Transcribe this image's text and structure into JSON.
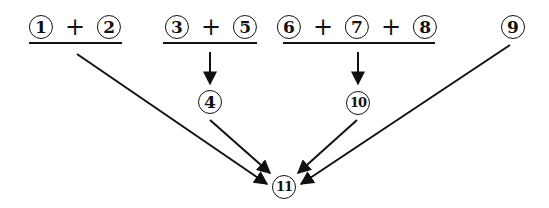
{
  "diagram": {
    "type": "flow",
    "groups": [
      {
        "id": "g1",
        "terms": [
          "1",
          "2"
        ],
        "operator": "+"
      },
      {
        "id": "g2",
        "terms": [
          "3",
          "5"
        ],
        "operator": "+",
        "result": "4"
      },
      {
        "id": "g3",
        "terms": [
          "6",
          "7",
          "8"
        ],
        "operator": "+",
        "result": "10"
      },
      {
        "id": "g4",
        "terms": [
          "9"
        ]
      }
    ],
    "final": "11",
    "edges": [
      {
        "from": "g1",
        "to": "11"
      },
      {
        "from": "g2",
        "to": "4"
      },
      {
        "from": "4",
        "to": "11"
      },
      {
        "from": "g3",
        "to": "10"
      },
      {
        "from": "10",
        "to": "11"
      },
      {
        "from": "9",
        "to": "11"
      }
    ]
  },
  "labels": {
    "n1": "1",
    "n2": "2",
    "n3": "3",
    "n4": "4",
    "n5": "5",
    "n6": "6",
    "n7": "7",
    "n8": "8",
    "n9": "9",
    "n10": "10",
    "n11": "11",
    "plus": "+"
  }
}
